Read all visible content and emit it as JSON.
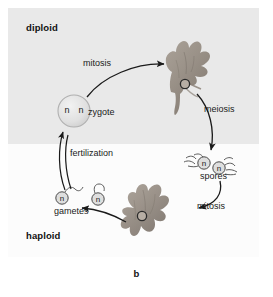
{
  "figure": {
    "caption": "b",
    "panel_background": "#fdfdfd"
  },
  "zones": {
    "diploid": {
      "label": "diploid",
      "background": "#e9e9e9"
    },
    "haploid": {
      "label": "haploid",
      "background": "#fcfcfc"
    }
  },
  "process_labels": {
    "mitosis_top": "mitosis",
    "meiosis": "meiosis",
    "mitosis_bottom": "mitosis",
    "fertilization": "fertilization"
  },
  "structures": {
    "zygote": {
      "label": "zygote",
      "ploidy_markers": [
        "n",
        "n"
      ],
      "fill": "#e3e3e3"
    },
    "spores": {
      "label": "spores",
      "ploidy_markers": [
        "n",
        "n"
      ],
      "fill": "#dcdcdc"
    },
    "gametes": {
      "label": "gametes",
      "ploidy_markers": [
        "n",
        "n"
      ],
      "fill": "#dcdcdc"
    },
    "sporophyte": {
      "name": "sporophyte-organism",
      "fill": "#9a9188"
    },
    "gametophyte": {
      "name": "gametophyte-organism",
      "fill": "#9a9188"
    }
  },
  "colors": {
    "arrow": "#1a1a1a",
    "text": "#1a1a1a",
    "organism": "#9a9188",
    "organism_shade": "#7d746b"
  }
}
